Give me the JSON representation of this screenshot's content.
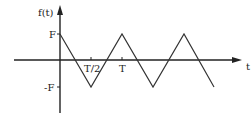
{
  "diagram": {
    "type": "triangle-waveform",
    "y_axis_label": "f(t)",
    "x_axis_label": "t",
    "y_ticks": {
      "top": "F",
      "bottom": "-F"
    },
    "x_ticks": {
      "half_period": "T/2",
      "period": "T"
    },
    "line_color": "#333333",
    "axis_color": "#222222"
  }
}
